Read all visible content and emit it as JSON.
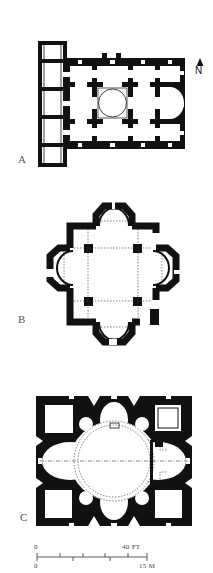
{
  "figure": {
    "plans": [
      {
        "label": "A",
        "description": "Cross-in-square church plan with narthex"
      },
      {
        "label": "B",
        "description": "Quatrefoil tetraconch plan"
      },
      {
        "label": "C",
        "description": "Domed octaconch plan with corner chambers"
      }
    ],
    "north_arrow": {
      "label": "N"
    },
    "scale_bar": {
      "ft_start": "0",
      "ft_end": "40 FT",
      "m_start": "0",
      "m_end": "15 M"
    }
  }
}
